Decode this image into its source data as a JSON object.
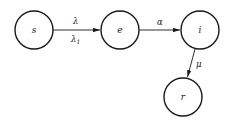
{
  "diagram": {
    "type": "state-transition",
    "nodes": [
      {
        "id": "s",
        "label": "s",
        "cx": 34,
        "cy": 30,
        "r": 19
      },
      {
        "id": "e",
        "label": "e",
        "cx": 120,
        "cy": 30,
        "r": 19
      },
      {
        "id": "i",
        "label": "i",
        "cx": 200,
        "cy": 30,
        "r": 19
      },
      {
        "id": "r",
        "label": "r",
        "cx": 183,
        "cy": 97,
        "r": 19
      }
    ],
    "edges": [
      {
        "from": "s",
        "to": "e",
        "label_above": "λ",
        "label_below_base": "λ",
        "label_below_sub": "1"
      },
      {
        "from": "e",
        "to": "i",
        "label_above": "α"
      },
      {
        "from": "i",
        "to": "r",
        "label": "μ"
      }
    ]
  }
}
